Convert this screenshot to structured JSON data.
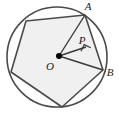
{
  "figure": {
    "background_color": "#ffffff",
    "stroke_color": "#4d4d4d",
    "dark_stroke_color": "#3a3a3a",
    "fill_color": "#f0f0f0",
    "point_color": "#000000",
    "label_color": "#1a1a1a"
  },
  "circle": {
    "center_x": 57,
    "center_y": 57,
    "radius": 50
  },
  "points": {
    "O": {
      "label": "O",
      "x": 59,
      "y": 56,
      "label_x": 50,
      "label_y": 67
    },
    "A": {
      "label": "A",
      "x": 85,
      "y": 15,
      "label_x": 88,
      "label_y": 7
    },
    "B": {
      "label": "B",
      "x": 103,
      "y": 70,
      "label_x": 110,
      "label_y": 73
    },
    "P": {
      "label": "P",
      "x": 86,
      "y": 47,
      "label_x": 82,
      "label_y": 41
    }
  },
  "polygon": {
    "name": "inscribed-pentagon",
    "vertices": [
      {
        "x": 85,
        "y": 15
      },
      {
        "x": 103,
        "y": 70
      },
      {
        "x": 62,
        "y": 107
      },
      {
        "x": 11,
        "y": 72
      },
      {
        "x": 26,
        "y": 21
      }
    ]
  },
  "segments": [
    {
      "name": "segment-OA",
      "x1": 59,
      "y1": 56,
      "x2": 85,
      "y2": 15
    },
    {
      "name": "segment-OB",
      "x1": 59,
      "y1": 56,
      "x2": 103,
      "y2": 70
    },
    {
      "name": "segment-OP",
      "x1": 59,
      "y1": 56,
      "x2": 86,
      "y2": 47
    }
  ],
  "right_angle_marker": {
    "name": "right-angle-at-P",
    "vertex_x": 86,
    "vertex_y": 47,
    "size": 7
  }
}
